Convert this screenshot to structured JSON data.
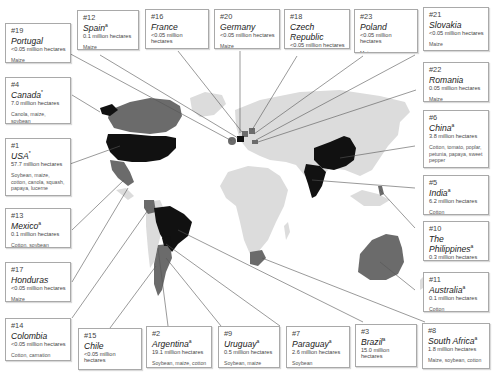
{
  "colors": {
    "background": "#ffffff",
    "land_base": "#dcdcdc",
    "major_grower": "#111111",
    "minor_grower": "#6b6b6b",
    "leader_line": "#555555",
    "card_border": "#a9a9a9"
  },
  "legend_notes": {
    "major_grower_fill": "black = 50,000 hectares or more",
    "minor_grower_fill": "grey = less than 50,000 hectares"
  },
  "countries": [
    {
      "rank": "#19",
      "name": "Portugal",
      "mark": "",
      "area": "<0.05 million hectares",
      "crops": "Maize"
    },
    {
      "rank": "#12",
      "name": "Spain",
      "mark": "a",
      "area": "0.1 million hectares",
      "crops": "Maize"
    },
    {
      "rank": "#16",
      "name": "France",
      "mark": "",
      "area": "<0.05 million hectares",
      "crops": "Maize"
    },
    {
      "rank": "#20",
      "name": "Germany",
      "mark": "",
      "area": "<0.05 million hectares",
      "crops": "Maize"
    },
    {
      "rank": "#18",
      "name": "Czech Republic",
      "mark": "",
      "area": "<0.05 million hectares",
      "crops": "Maize"
    },
    {
      "rank": "#23",
      "name": "Poland",
      "mark": "",
      "area": "<0.05 million hectares",
      "crops": "Maize"
    },
    {
      "rank": "#21",
      "name": "Slovakia",
      "mark": "",
      "area": "<0.05 million hectares",
      "crops": "Maize"
    },
    {
      "rank": "#22",
      "name": "Romania",
      "mark": "",
      "area": "0.05 million hectares",
      "crops": "Maize"
    },
    {
      "rank": "#4",
      "name": "Canada",
      "mark": "*",
      "area": "7.0 million hectares",
      "crops": "Canola, maize, soybean"
    },
    {
      "rank": "#1",
      "name": "USA",
      "mark": "*",
      "area": "57.7 million hectares",
      "crops": "Soybean, maize, cotton, canola, squash, papaya, lucerne"
    },
    {
      "rank": "#6",
      "name": "China",
      "mark": "a",
      "area": "3.8 million hectares",
      "crops": "Cotton, tomato, poplar, petunia, papaya, sweet pepper"
    },
    {
      "rank": "#5",
      "name": "India",
      "mark": "a",
      "area": "6.2 million hectares",
      "crops": "Cotton"
    },
    {
      "rank": "#13",
      "name": "Mexico",
      "mark": "a",
      "area": "0.1 million hectares",
      "crops": "Cotton, soybean"
    },
    {
      "rank": "#10",
      "name": "The Philippines",
      "mark": "a",
      "area": "0.3 million hectares",
      "crops": "Maize"
    },
    {
      "rank": "#17",
      "name": "Honduras",
      "mark": "",
      "area": "<0.05 million hectares",
      "crops": "Maize"
    },
    {
      "rank": "#11",
      "name": "Australia",
      "mark": "a",
      "area": "0.1 million hectares",
      "crops": "Cotton"
    },
    {
      "rank": "#14",
      "name": "Colombia",
      "mark": "",
      "area": "<0.05 million hectares",
      "crops": "Cotton, carnation"
    },
    {
      "rank": "#15",
      "name": "Chile",
      "mark": "",
      "area": "<0.05 million hectares",
      "crops": "Maize, soybean, canola"
    },
    {
      "rank": "#2",
      "name": "Argentina",
      "mark": "a",
      "area": "19.1 million hectares",
      "crops": "Soybean, maize, cotton"
    },
    {
      "rank": "#9",
      "name": "Uruguay",
      "mark": "a",
      "area": "0.5 million hectares",
      "crops": "Soybean, maize"
    },
    {
      "rank": "#7",
      "name": "Paraguay",
      "mark": "a",
      "area": "2.6 million hectares",
      "crops": "Soybean"
    },
    {
      "rank": "#3",
      "name": "Brazil",
      "mark": "a",
      "area": "15.0 million hectares",
      "crops": "Soybean, cotton"
    },
    {
      "rank": "#8",
      "name": "South Africa",
      "mark": "a",
      "area": "1.8 million hectares",
      "crops": "Maize, soybean, cotton"
    }
  ]
}
